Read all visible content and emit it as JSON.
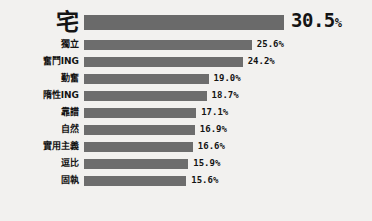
{
  "chart_data": {
    "type": "bar",
    "orientation": "horizontal",
    "title": "",
    "subtitle": "",
    "xlabel": "",
    "ylabel": "",
    "grid": false,
    "legend": null,
    "value_suffix": "%",
    "xlim": [
      0,
      30.5
    ],
    "categories": [
      "宅",
      "獨立",
      "奮鬥ING",
      "勤奮",
      "隋性ING",
      "靠譜",
      "自然",
      "實用主義",
      "逗比",
      "固執"
    ],
    "values": [
      30.5,
      25.6,
      24.2,
      19.0,
      18.7,
      17.1,
      16.9,
      16.6,
      15.9,
      15.6
    ],
    "value_labels": [
      "30.5%",
      "25.6%",
      "24.2%",
      "19.0%",
      "18.7%",
      "17.1%",
      "16.9%",
      "16.6%",
      "15.9%",
      "15.6%"
    ],
    "bar_color": "#6d6d6d",
    "background_color": "#f2f1ef",
    "text_color": "#141414"
  },
  "rows": [
    {
      "label": "宅",
      "value": 30.5,
      "value_label": "30.5",
      "pct": "%",
      "featured": true
    },
    {
      "label": "獨立",
      "value": 25.6,
      "value_label": "25.6%",
      "featured": false
    },
    {
      "label": "奮鬥ING",
      "value": 24.2,
      "value_label": "24.2%",
      "featured": false
    },
    {
      "label": "勤奮",
      "value": 19.0,
      "value_label": "19.0%",
      "featured": false
    },
    {
      "label": "隋性ING",
      "value": 18.7,
      "value_label": "18.7%",
      "featured": false
    },
    {
      "label": "靠譜",
      "value": 17.1,
      "value_label": "17.1%",
      "featured": false
    },
    {
      "label": "自然",
      "value": 16.9,
      "value_label": "16.9%",
      "featured": false
    },
    {
      "label": "實用主義",
      "value": 16.6,
      "value_label": "16.6%",
      "featured": false
    },
    {
      "label": "逗比",
      "value": 15.9,
      "value_label": "15.9%",
      "featured": false
    },
    {
      "label": "固執",
      "value": 15.6,
      "value_label": "15.6%",
      "featured": false
    }
  ]
}
